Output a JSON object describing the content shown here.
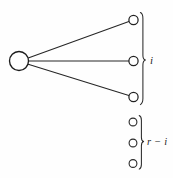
{
  "figure": {
    "background_color": "#fefefe",
    "stroke_color": "#262626",
    "width": 173,
    "height": 178
  },
  "hub": {
    "name": "source-vertex",
    "cx": 19,
    "cy": 61,
    "r": 9.5,
    "filled": false
  },
  "connected_group": {
    "label": "i",
    "count": 3,
    "nodes": [
      {
        "cx": 133.5,
        "cy": 20.0,
        "r": 4.6
      },
      {
        "cx": 133.5,
        "cy": 61.0,
        "r": 4.6
      },
      {
        "cx": 133.5,
        "cy": 97.0,
        "r": 4.6
      }
    ],
    "brace": {
      "x": 143.0,
      "top": 12.0,
      "bottom": 105.0,
      "tip_y": 60.0
    }
  },
  "unconnected_group": {
    "label": "r − i",
    "count": 3,
    "nodes": [
      {
        "cx": 133.0,
        "cy": 122.0,
        "r": 3.9
      },
      {
        "cx": 133.0,
        "cy": 143.0,
        "r": 3.9
      },
      {
        "cx": 133.0,
        "cy": 163.5,
        "r": 3.9
      }
    ],
    "brace": {
      "x": 141.5,
      "top": 115.0,
      "bottom": 170.0,
      "tip_y": 142.5
    }
  },
  "edges": [
    {
      "name": "edge-to-node-1",
      "x1": 28.2,
      "y1": 58.0,
      "x2": 128.9,
      "y2": 21.4
    },
    {
      "name": "edge-to-node-2",
      "x1": 28.5,
      "y1": 61.0,
      "x2": 128.9,
      "y2": 61.0
    },
    {
      "name": "edge-to-node-3",
      "x1": 28.2,
      "y1": 64.2,
      "x2": 128.9,
      "y2": 95.6
    }
  ]
}
